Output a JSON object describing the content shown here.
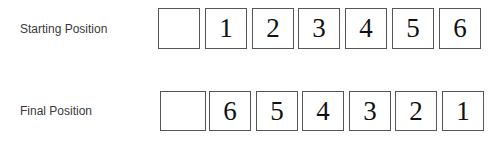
{
  "rows": [
    {
      "label": "Starting Position",
      "cells": [
        "",
        "1",
        "2",
        "3",
        "4",
        "5",
        "6"
      ]
    },
    {
      "label": "Final Position",
      "cells": [
        "",
        "6",
        "5",
        "4",
        "3",
        "2",
        "1"
      ]
    }
  ]
}
